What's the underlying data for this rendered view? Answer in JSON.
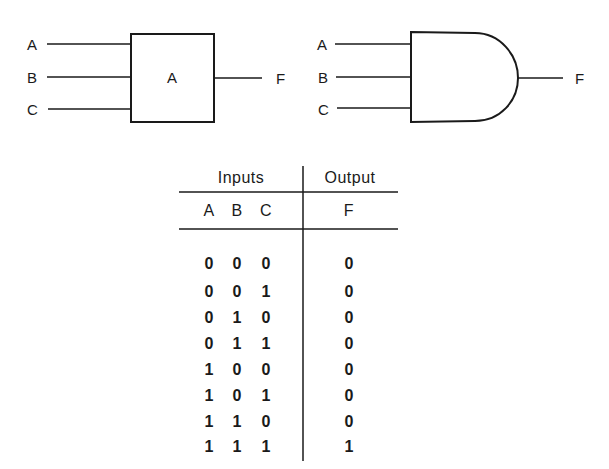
{
  "block_gate": {
    "inputs": [
      "A",
      "B",
      "C"
    ],
    "label": "A",
    "output": "F"
  },
  "and_gate": {
    "inputs": [
      "A",
      "B",
      "C"
    ],
    "output": "F"
  },
  "truth_table": {
    "group_headers": {
      "inputs": "Inputs",
      "output": "Output"
    },
    "columns": {
      "a": "A",
      "b": "B",
      "c": "C",
      "f": "F"
    },
    "rows": [
      {
        "a": "0",
        "b": "0",
        "c": "0",
        "f": "0"
      },
      {
        "a": "0",
        "b": "0",
        "c": "1",
        "f": "0"
      },
      {
        "a": "0",
        "b": "1",
        "c": "0",
        "f": "0"
      },
      {
        "a": "0",
        "b": "1",
        "c": "1",
        "f": "0"
      },
      {
        "a": "1",
        "b": "0",
        "c": "0",
        "f": "0"
      },
      {
        "a": "1",
        "b": "0",
        "c": "1",
        "f": "0"
      },
      {
        "a": "1",
        "b": "1",
        "c": "0",
        "f": "0"
      },
      {
        "a": "1",
        "b": "1",
        "c": "1",
        "f": "1"
      }
    ]
  }
}
